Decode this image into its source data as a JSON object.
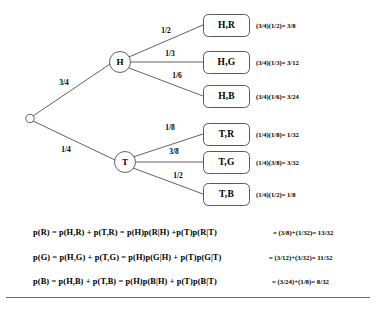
{
  "diagram": {
    "type": "probability-tree",
    "root": {
      "label": "",
      "icon": "root-node-circle"
    },
    "level1": [
      {
        "id": "H",
        "label": "H",
        "probability": "3/4"
      },
      {
        "id": "T",
        "label": "T",
        "probability": "1/4"
      }
    ],
    "branches": [
      {
        "from": "root",
        "to": "H",
        "label": "3/4"
      },
      {
        "from": "root",
        "to": "T",
        "label": "1/4"
      },
      {
        "from": "H",
        "to": "H,R",
        "label": "1/2"
      },
      {
        "from": "H",
        "to": "H,G",
        "label": "1/3"
      },
      {
        "from": "H",
        "to": "H,B",
        "label": "1/6"
      },
      {
        "from": "T",
        "to": "T,R",
        "label": "1/8"
      },
      {
        "from": "T",
        "to": "T,G",
        "label": "3/8"
      },
      {
        "from": "T",
        "to": "T,B",
        "label": "1/2"
      }
    ],
    "outcomes": [
      {
        "label": "H,R",
        "calculation": "(3/4)(1/2)= 3/8"
      },
      {
        "label": "H,G",
        "calculation": "(3/4)(1/3)= 3/12"
      },
      {
        "label": "H,B",
        "calculation": "(3/4)(1/6)= 3/24"
      },
      {
        "label": "T,R",
        "calculation": "(1/4)(1/8)= 1/32"
      },
      {
        "label": "T,G",
        "calculation": "(1/4)(3/8)= 3/32"
      },
      {
        "label": "T,B",
        "calculation": "(1/4)(1/2)= 1/8"
      }
    ],
    "equations": [
      {
        "expression": "p(R) = p(H,R) + p(T,R) = p(H)p(R|H) +p(T)p(R|T)",
        "result": "= (3/8)+(1/32)= 13/32"
      },
      {
        "expression": "p(G) = p(H,G) + p(T,G) = p(H)p(G|H) + p(T)p(G|T)",
        "result": "= (3/12)+(3/32)= 11/32"
      },
      {
        "expression": "p(B) = p(H,B) + p(T,B) = p(H)p(B|H) + p(T)p(B|T)",
        "result": "= (3/24)+(1/8)= 8/32"
      }
    ]
  },
  "colors": {
    "background": "#ffffff",
    "line": "#3a3a3a",
    "box_border": "#5a5a5a",
    "text": "#000000",
    "rule": "#6a6a6a"
  }
}
